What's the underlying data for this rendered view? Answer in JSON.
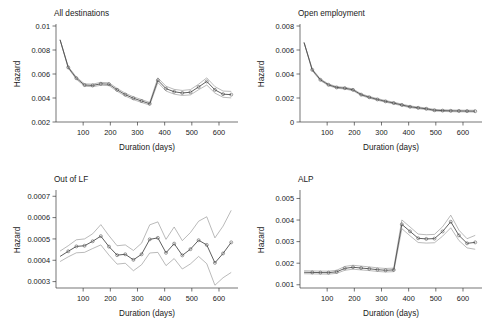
{
  "figure": {
    "background": "#ffffff",
    "line_color": "#4d4d4d",
    "band_color": "#8c8c8c",
    "axis_color": "#3a3a3a",
    "panel_count": 4
  },
  "chart_data": [
    {
      "type": "line",
      "title": "All destinations",
      "xlabel": "Duration (days)",
      "ylabel": "Hazard",
      "xlim": [
        0,
        670
      ],
      "ylim": [
        0.002,
        0.01
      ],
      "xticks": [
        100,
        200,
        300,
        400,
        500,
        600
      ],
      "xtick_labels": [
        "100",
        "200",
        "300",
        "400",
        "500",
        "600"
      ],
      "yticks": [
        0.002,
        0.004,
        0.006,
        0.008,
        0.01
      ],
      "ytick_labels": [
        "0.002",
        "0.004",
        "0.006",
        "0.008",
        "0.01"
      ],
      "grid": false,
      "legend": "none",
      "markers": true,
      "x": [
        15,
        45,
        75,
        105,
        135,
        165,
        195,
        225,
        255,
        285,
        315,
        345,
        375,
        405,
        435,
        465,
        495,
        525,
        555,
        585,
        615,
        645
      ],
      "series": [
        {
          "name": "Hazard estimate",
          "role": "point_estimate",
          "values": [
            0.00885,
            0.00655,
            0.00565,
            0.00508,
            0.00505,
            0.00518,
            0.00515,
            0.00468,
            0.00428,
            0.00398,
            0.00375,
            0.00352,
            0.00548,
            0.00478,
            0.00452,
            0.00442,
            0.00448,
            0.00492,
            0.00538,
            0.00468,
            0.00432,
            0.00428
          ]
        },
        {
          "name": "Upper 95% CI",
          "role": "upper_ci",
          "values": [
            0.00885,
            0.00662,
            0.00575,
            0.00518,
            0.00516,
            0.0053,
            0.00527,
            0.0048,
            0.0044,
            0.0041,
            0.00387,
            0.00363,
            0.00568,
            0.00498,
            0.00472,
            0.00463,
            0.0047,
            0.00515,
            0.00568,
            0.00495,
            0.00458,
            0.00455
          ]
        },
        {
          "name": "Lower 95% CI",
          "role": "lower_ci",
          "values": [
            0.00885,
            0.00648,
            0.00556,
            0.00498,
            0.00494,
            0.00506,
            0.00503,
            0.00456,
            0.00416,
            0.00386,
            0.00363,
            0.00341,
            0.00529,
            0.00458,
            0.00432,
            0.00421,
            0.00426,
            0.00469,
            0.00508,
            0.00441,
            0.00406,
            0.00401
          ]
        }
      ]
    },
    {
      "type": "line",
      "title": "Open employment",
      "xlabel": "Duration (days)",
      "ylabel": "Hazard",
      "xlim": [
        0,
        670
      ],
      "ylim": [
        0,
        0.008
      ],
      "xticks": [
        100,
        200,
        300,
        400,
        500,
        600
      ],
      "xtick_labels": [
        "100",
        "200",
        "300",
        "400",
        "500",
        "600"
      ],
      "yticks": [
        0,
        0.002,
        0.004,
        0.006,
        0.008
      ],
      "ytick_labels": [
        "0",
        "0.002",
        "0.004",
        "0.006",
        "0.008"
      ],
      "grid": false,
      "legend": "none",
      "markers": true,
      "x": [
        15,
        45,
        75,
        105,
        135,
        165,
        195,
        225,
        255,
        285,
        315,
        345,
        375,
        405,
        435,
        465,
        495,
        525,
        555,
        585,
        615,
        645
      ],
      "series": [
        {
          "name": "Hazard estimate",
          "role": "point_estimate",
          "values": [
            0.00662,
            0.00435,
            0.00352,
            0.0031,
            0.00288,
            0.00282,
            0.00268,
            0.00228,
            0.00206,
            0.00188,
            0.00172,
            0.00158,
            0.00142,
            0.00127,
            0.00118,
            0.0011,
            0.00098,
            0.00095,
            0.00093,
            0.00092,
            0.00091,
            0.0009
          ]
        },
        {
          "name": "Upper 95% CI",
          "role": "upper_ci",
          "values": [
            0.00662,
            0.00443,
            0.00359,
            0.00317,
            0.00295,
            0.00289,
            0.00275,
            0.00235,
            0.00213,
            0.00195,
            0.00179,
            0.00165,
            0.00149,
            0.00134,
            0.00125,
            0.00117,
            0.00105,
            0.00102,
            0.001,
            0.00099,
            0.00098,
            0.00098
          ]
        },
        {
          "name": "Lower 95% CI",
          "role": "lower_ci",
          "values": [
            0.00662,
            0.00427,
            0.00345,
            0.00303,
            0.00281,
            0.00275,
            0.00261,
            0.00221,
            0.00199,
            0.00181,
            0.00165,
            0.00151,
            0.00135,
            0.0012,
            0.00111,
            0.00103,
            0.00091,
            0.00088,
            0.00086,
            0.00085,
            0.00084,
            0.00083
          ]
        }
      ]
    },
    {
      "type": "line",
      "title": "Out of LF",
      "xlabel": "Duration (days)",
      "ylabel": "Hazard",
      "xlim": [
        0,
        670
      ],
      "ylim": [
        0.00027,
        0.00072
      ],
      "xticks": [
        100,
        200,
        300,
        400,
        500,
        600
      ],
      "xtick_labels": [
        "100",
        "200",
        "300",
        "400",
        "500",
        "600"
      ],
      "yticks": [
        0.0003,
        0.0004,
        0.0005,
        0.0006,
        0.0007
      ],
      "ytick_labels": [
        "0.0003",
        "0.0004",
        "0.0005",
        "0.0006",
        "0.0007"
      ],
      "grid": false,
      "legend": "none",
      "markers": true,
      "x": [
        15,
        45,
        75,
        105,
        135,
        165,
        195,
        225,
        255,
        285,
        315,
        345,
        375,
        405,
        435,
        465,
        495,
        525,
        555,
        585,
        615,
        645
      ],
      "series": [
        {
          "name": "Hazard estimate",
          "role": "point_estimate",
          "values": [
            0.000418,
            0.000442,
            0.000465,
            0.000468,
            0.000489,
            0.000513,
            0.000464,
            0.000424,
            0.000428,
            0.000402,
            0.000428,
            0.000498,
            0.000505,
            0.000435,
            0.000478,
            0.000423,
            0.000452,
            0.000494,
            0.000472,
            0.000388,
            0.000432,
            0.000484
          ]
        },
        {
          "name": "Upper 95% CI",
          "role": "upper_ci",
          "values": [
            0.000443,
            0.000468,
            0.000496,
            0.0005,
            0.000524,
            0.000567,
            0.000515,
            0.000468,
            0.000472,
            0.000446,
            0.00048,
            0.000566,
            0.00058,
            0.000498,
            0.000556,
            0.000492,
            0.00053,
            0.000583,
            0.000604,
            0.000505,
            0.00056,
            0.000634
          ]
        },
        {
          "name": "Lower 95% CI",
          "role": "lower_ci",
          "values": [
            0.000394,
            0.000416,
            0.000435,
            0.000437,
            0.000455,
            0.000472,
            0.000424,
            0.000382,
            0.000386,
            0.000351,
            0.000379,
            0.000434,
            0.000437,
            0.000375,
            0.000408,
            0.000359,
            0.000383,
            0.000418,
            0.000384,
            0.000283,
            0.000318,
            0.000343
          ]
        }
      ]
    },
    {
      "type": "line",
      "title": "ALP",
      "xlabel": "Duration (days)",
      "ylabel": "Hazard",
      "xlim": [
        0,
        670
      ],
      "ylim": [
        0.00085,
        0.0053
      ],
      "xticks": [
        100,
        200,
        300,
        400,
        500,
        600
      ],
      "xtick_labels": [
        "100",
        "200",
        "300",
        "400",
        "500",
        "600"
      ],
      "yticks": [
        0.001,
        0.002,
        0.003,
        0.004,
        0.005
      ],
      "ytick_labels": [
        "0.001",
        "0.002",
        "0.003",
        "0.004",
        "0.005"
      ],
      "grid": false,
      "legend": "none",
      "markers": true,
      "x": [
        15,
        45,
        75,
        105,
        135,
        165,
        195,
        225,
        255,
        285,
        315,
        345,
        375,
        405,
        435,
        465,
        495,
        525,
        555,
        585,
        615,
        645
      ],
      "series": [
        {
          "name": "Hazard estimate",
          "role": "point_estimate",
          "values": [
            0.00158,
            0.001572,
            0.001565,
            0.001562,
            0.0016,
            0.00176,
            0.001812,
            0.001775,
            0.001742,
            0.0017,
            0.001672,
            0.001688,
            0.0038,
            0.003475,
            0.003155,
            0.003125,
            0.00314,
            0.00347,
            0.00392,
            0.00329,
            0.00292,
            0.002965
          ]
        },
        {
          "name": "Upper 95% CI",
          "role": "upper_ci",
          "values": [
            0.00165,
            0.001642,
            0.001634,
            0.00163,
            0.001672,
            0.00185,
            0.001905,
            0.001865,
            0.001828,
            0.001785,
            0.001755,
            0.001772,
            0.004005,
            0.00368,
            0.00335,
            0.003318,
            0.003335,
            0.00369,
            0.004225,
            0.00353,
            0.003135,
            0.00329
          ]
        },
        {
          "name": "Lower 95% CI",
          "role": "lower_ci",
          "values": [
            0.001512,
            0.001504,
            0.001497,
            0.001494,
            0.00153,
            0.001672,
            0.001722,
            0.001688,
            0.001658,
            0.001618,
            0.001592,
            0.001607,
            0.0036,
            0.003272,
            0.00296,
            0.002932,
            0.002947,
            0.003252,
            0.00364,
            0.003053,
            0.002708,
            0.002645
          ]
        }
      ]
    }
  ]
}
